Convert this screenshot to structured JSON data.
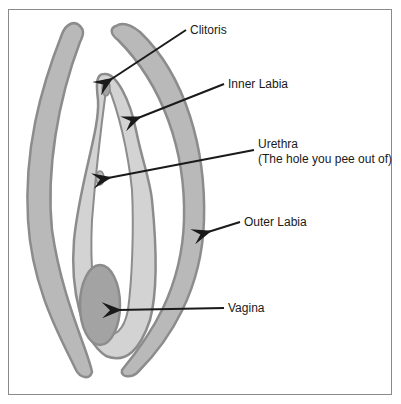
{
  "diagram": {
    "type": "anatomy",
    "colors": {
      "outline": "#8c8c8c",
      "fill_outer": "#b9b9b9",
      "fill_inner": "#d3d3d3",
      "fill_vagina": "#a3a3a3",
      "arrow": "#1a1a1a",
      "frame": "#8a8a8a"
    },
    "labels": [
      {
        "id": "clitoris",
        "text": "Clitoris"
      },
      {
        "id": "inner-labia",
        "text": "Inner Labia"
      },
      {
        "id": "urethra",
        "text": "Urethra"
      },
      {
        "id": "urethra-note",
        "text": "(The hole you pee out of)"
      },
      {
        "id": "outer-labia",
        "text": "Outer Labia"
      },
      {
        "id": "vagina",
        "text": "Vagina"
      }
    ]
  }
}
